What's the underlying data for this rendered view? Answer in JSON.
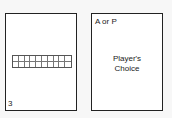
{
  "cards": [
    {
      "id": "left",
      "corner_label": "3",
      "grid": {
        "columns": 10,
        "rows": 2
      }
    },
    {
      "id": "right",
      "corner_label": "A or P",
      "center_lines": [
        "Player's",
        "Choice"
      ]
    }
  ]
}
